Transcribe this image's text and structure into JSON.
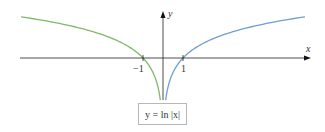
{
  "figure": {
    "x_axis_label": "x",
    "y_axis_label": "y",
    "tick_neg1": "−1",
    "tick_pos1": "1",
    "equation": "y = ln |x|",
    "colors": {
      "left_curve": "#7fb96a",
      "right_curve": "#6f9fd0",
      "axis": "#222222"
    }
  },
  "chart_data": {
    "type": "line",
    "title": "y = ln |x|",
    "xlabel": "x",
    "ylabel": "y",
    "xlim": [
      -7.2,
      7.2
    ],
    "ylim": [
      -2,
      2.2
    ],
    "grid": false,
    "x_ticks": [
      -1,
      1
    ],
    "series": [
      {
        "name": "left branch (x<0)",
        "color": "#7fb96a",
        "x": [
          -7.1,
          -5,
          -3,
          -2,
          -1,
          -0.5,
          -0.25,
          -0.135
        ],
        "y": [
          1.96,
          1.61,
          1.1,
          0.69,
          0,
          -0.69,
          -1.39,
          -2.0
        ]
      },
      {
        "name": "right branch (x>0)",
        "color": "#6f9fd0",
        "x": [
          0.135,
          0.25,
          0.5,
          1,
          2,
          3,
          5,
          7.1
        ],
        "y": [
          -2.0,
          -1.39,
          -0.69,
          0,
          0.69,
          1.1,
          1.61,
          1.96
        ]
      }
    ]
  }
}
